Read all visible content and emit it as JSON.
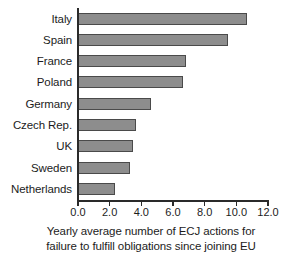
{
  "chart_data": {
    "type": "bar",
    "orientation": "horizontal",
    "title": "",
    "subtitle": "",
    "xlabel_line1": "Yearly average number of ECJ actions for",
    "xlabel_line2": "failure to fulfill obligations since joining EU",
    "ylabel": "",
    "categories": [
      "Italy",
      "Spain",
      "France",
      "Poland",
      "Germany",
      "Czech Rep.",
      "UK",
      "Sweden",
      "Netherlands"
    ],
    "values": [
      10.7,
      9.5,
      6.8,
      6.6,
      4.6,
      3.65,
      3.5,
      3.3,
      2.35
    ],
    "xlim": [
      0.0,
      12.0
    ],
    "xticks": [
      0.0,
      2.0,
      4.0,
      6.0,
      8.0,
      10.0,
      12.0
    ],
    "xtick_labels": [
      "0.0",
      "2.0",
      "4.0",
      "6.0",
      "8.0",
      "10.0",
      "12.0"
    ],
    "grid": false,
    "legend": null,
    "bar_color": "#8d8d8d",
    "bar_edge_color": "#4a4a4a",
    "axis_color": "#2a2a2a",
    "background": "#ffffff"
  }
}
